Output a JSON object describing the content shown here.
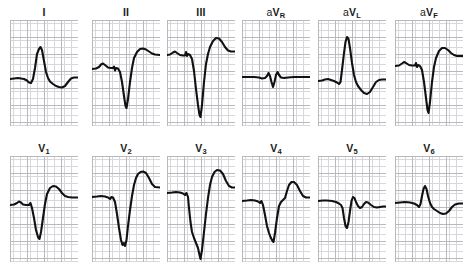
{
  "figure": {
    "kind": "12-lead-ecg",
    "rows": 2,
    "columns": 6,
    "background_color": "#ffffff",
    "trace_color": "#111111",
    "grid_minor_color": "#d8d8dc",
    "grid_major_color": "#b9b9bd"
  },
  "chart_data": {
    "type": "line",
    "title": "",
    "xlabel": "",
    "ylabel": "",
    "grid": true,
    "legend": "none",
    "xlim": [
      0,
      68
    ],
    "ylim": [
      0,
      106
    ],
    "note": "Each panel is one ECG lead plotted on graph paper. Values are polyline vertices in panel pixel coordinates; y increases downward, baseline near y=58.",
    "series": [
      {
        "name": "I",
        "row": 0,
        "column": 0,
        "baseline": 58,
        "points": "0,59 4,58.5 8,58 11,58.5 14,59 17,60.5 19,62.5 21,63 23,59 25,48 27,34 29,29 30.5,27 32,30 34,41 36,52 38,58 40,61.5 43,64 46,66 49,67 52,67.5 55,66 58,62 61,58.5 64,57.5 68,57.5"
      },
      {
        "name": "II",
        "row": 0,
        "column": 1,
        "baseline": 48,
        "points": "0,49 4,48.5 7,47 9,44.5 11,43.5 13,45 16,47.5 19,48 21,48 22,46.5 23,50.5 24,48 26,48.5 28,52 30,62 32,76 33.5,86 34.5,88 36,79 38,62 40,48 42,38 45,32 48,29 51,28.5 54,29.5 57,31.5 60,33.5 63,34.5 68,35"
      },
      {
        "name": "III",
        "row": 0,
        "column": 2,
        "baseline": 34,
        "points": "0,35 3,34.5 6,32.5 8,31.5 10,33 13,35 16,35.5 18,35.5 19,32 20,36 21,34 23,35 25,39 27,51 29,69 31,85 32.5,95 33.5,97 35,85 37,62 39,44 41,34 43,27 46,21 49,18 52,18.5 55,22 58,27 61,30.5 64,31.5 68,31.5"
      },
      {
        "name": "aVR",
        "row": 0,
        "column": 3,
        "baseline": 57,
        "points": "0,57 6,57 12,57 17,57.5 20,58.5 23,58 25,56 26.5,53 28,56 29.5,62 31,67 32.5,62 34,55 35.5,52 37,55 39,57.5 42,58 46,57.5 52,57 60,57 68,57"
      },
      {
        "name": "aVL",
        "row": 0,
        "column": 4,
        "baseline": 60,
        "points": "0,61 4,60.5 7,59.5 10,59 13,60 16,61 19,62.5 21,64 22.5,62 24,50 26,33 27.5,22 29,17 30.5,19 32,28 34,43 36,55 38,62 40,66 43,70 46,73 49,74 52,72 55,67 58,62 61,60 64,59.5 68,59.5"
      },
      {
        "name": "aVF",
        "row": 0,
        "column": 5,
        "baseline": 45,
        "points": "0,46 4,45.5 7,43.5 9,42 11,43 14,45 17,45.5 20,45.5 21,43 22,47 23.5,45 25,46 27,50 29,62 31,78 32.5,90 33.5,93 35,82 37,62 39,47 41,38 44,31 47,28 50,28 53,30 56,33 59,35 62,36 68,36"
      },
      {
        "name": "V1",
        "row": 1,
        "column": 0,
        "baseline": 48,
        "points": "0,49 4,48.5 7,47 9,45.5 11,46.5 13,48.5 16,49 19,49 20.5,47 22,52 24,62 26,74 28,81 29.5,83 31,76 33,62 35,48 37,38 40,32 43,30 46,30.5 49,33 52,37 55,40 58,41 62,41.5 68,41.5"
      },
      {
        "name": "V2",
        "row": 1,
        "column": 1,
        "baseline": 40,
        "points": "0,41 5,40.5 9,40 13,40.5 16,41.5 18,43 19.5,41 21,41.5 23,46 25,58 27,72 29,84 30.5,89 32,87 33,90 34.5,84 36,70 38,54 40,40 42,29 44,22 46,18 48.5,16 51,15.5 54,17 57,22 60,28 63,31 68,31.5"
      },
      {
        "name": "V3",
        "row": 1,
        "column": 2,
        "baseline": 36,
        "points": "0,37 5,36.5 9,36 13,36.5 16,37.5 18,39 19.5,37 21,41 22,52 23.5,66 25,76 27,82 29,87 31,92 32.5,99 33.5,103 35,94 37,76 39,58 41,42 43,29 45,21 47.5,16 50,14 53,14.5 56,18 59,25 62,30 65,31.5 68,31.5"
      },
      {
        "name": "V4",
        "row": 1,
        "column": 3,
        "baseline": 44,
        "points": "0,45 5,44.5 9,44 13,44.5 16,45.5 18,47 19.5,45 21,49 23,59 25,70 27,77 28.5,81 30,84 31.5,86 33,77 35,62 37,50 39,46 41,44 43,42 45,35 47,29 49.5,26 52,26 55,29 58,35 61,40 64,41.5 68,41.5"
      },
      {
        "name": "V5",
        "row": 1,
        "column": 4,
        "baseline": 44,
        "points": "0,45 5,44.5 9,44.5 14,45 18,46 21,47.5 23,49 24.5,52 26,62 27.5,70 29,72 30.5,66 32,55 33.5,45 35,41 36.5,42 38,46 40,50 42,52 44,51 46,48 48,46 50,46.5 53,49 56,51 59,51.5 62,51 65,50.5 68,50.5"
      },
      {
        "name": "V6",
        "row": 1,
        "column": 5,
        "baseline": 46,
        "points": "0,47 5,46.5 10,46 15,46.5 19,47.5 22,49 24,51 25.5,48 27,40 28.5,33 30,30 31.5,33 33,40 35,47 37,51 39,53 42,55 45,57 48,58 51,57.5 54,55 57,51 60,48.5 64,47.5 68,47.5"
      }
    ]
  },
  "leads": {
    "limb": [
      {
        "id": "I",
        "prefix": "",
        "main": "I",
        "subscript": ""
      },
      {
        "id": "II",
        "prefix": "",
        "main": "II",
        "subscript": ""
      },
      {
        "id": "III",
        "prefix": "",
        "main": "III",
        "subscript": ""
      },
      {
        "id": "aVR",
        "prefix": "a",
        "main": "V",
        "subscript": "R"
      },
      {
        "id": "aVL",
        "prefix": "a",
        "main": "V",
        "subscript": "L"
      },
      {
        "id": "aVF",
        "prefix": "a",
        "main": "V",
        "subscript": "F"
      }
    ],
    "chest": [
      {
        "id": "V1",
        "prefix": "",
        "main": "V",
        "subscript": "1"
      },
      {
        "id": "V2",
        "prefix": "",
        "main": "V",
        "subscript": "2"
      },
      {
        "id": "V3",
        "prefix": "",
        "main": "V",
        "subscript": "3"
      },
      {
        "id": "V4",
        "prefix": "",
        "main": "V",
        "subscript": "4"
      },
      {
        "id": "V5",
        "prefix": "",
        "main": "V",
        "subscript": "5"
      },
      {
        "id": "V6",
        "prefix": "",
        "main": "V",
        "subscript": "6"
      }
    ]
  }
}
